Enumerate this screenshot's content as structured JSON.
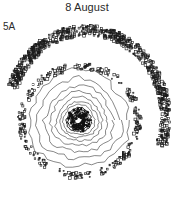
{
  "figure": {
    "title": "8 August",
    "panel_label": "5A",
    "type": "contour",
    "center": {
      "x": 79,
      "y": 120
    },
    "inner_contour_radii": [
      4,
      6,
      8,
      10,
      12,
      15,
      18,
      22,
      27,
      33,
      40,
      48
    ],
    "band_ring_radius": 52,
    "outer_spiral_band": {
      "start_angle_deg": 200,
      "end_angle_deg": 380,
      "radius_start": 76,
      "radius_end": 82
    },
    "colors": {
      "line": "#1a1a1a",
      "background": "#ffffff"
    }
  }
}
